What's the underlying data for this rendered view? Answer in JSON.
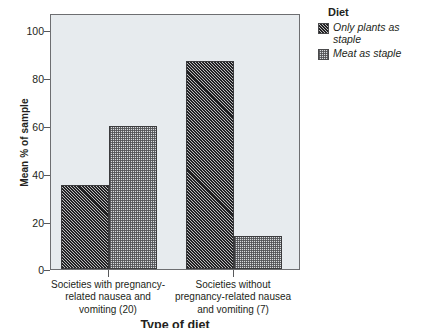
{
  "chart_data": {
    "type": "bar",
    "title": "",
    "xlabel": "Type of diet",
    "ylabel": "Mean % of sample",
    "ylim": [
      0,
      105
    ],
    "yticks": [
      0,
      20,
      40,
      60,
      80,
      100
    ],
    "ytick_labels": [
      "0",
      "20",
      "40",
      "60",
      "80",
      "100"
    ],
    "grid": false,
    "legend_position": "right",
    "legend_title": "Diet",
    "categories": [
      "Societies with pregnancy-related nausea and vomiting (20)",
      "Societies without pregnancy-related nausea and vomiting (7)"
    ],
    "category_lines": [
      [
        "Societies with pregnancy-",
        "related nausea and",
        "vomiting (20)"
      ],
      [
        "Societies without",
        "pregnancy-related nausea",
        "and vomiting (7)"
      ]
    ],
    "series": [
      {
        "name": "Only plants as staple",
        "values": [
          35,
          87
        ],
        "fill": "diagonal-hatch-dark",
        "color": "#4a4a4c"
      },
      {
        "name": "Meat as staple",
        "values": [
          60,
          14
        ],
        "fill": "dotted-light",
        "color": "#d9dcdf"
      }
    ]
  },
  "legend": {
    "title": "Diet",
    "entries": [
      {
        "label_lines": [
          "Only plants as",
          "staple"
        ],
        "label": "Only plants as staple"
      },
      {
        "label_lines": [
          "Meat as staple"
        ],
        "label": "Meat as staple"
      }
    ]
  },
  "axes": {
    "y_title": "Mean % of sample",
    "x_title": "Type of diet",
    "y_ticks": [
      "100",
      "80",
      "60",
      "40",
      "20",
      "0"
    ]
  },
  "colors": {
    "plot_background": "#e7ebee",
    "frame": "#6d6e71",
    "bar_dark": "#4a4a4c",
    "bar_light": "#d9dcdf",
    "text": "#231f20"
  }
}
